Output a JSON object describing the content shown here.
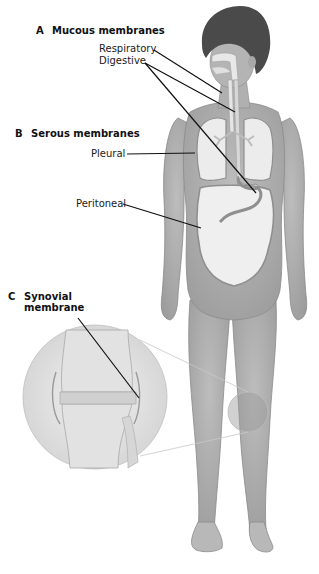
{
  "sections": {
    "a": {
      "letter": "A",
      "title": "Mucous membranes",
      "labels": {
        "respiratory": "Respiratory",
        "digestive": "Digestive"
      }
    },
    "b": {
      "letter": "B",
      "title": "Serous membranes",
      "labels": {
        "pleural": "Pleural",
        "peritoneal": "Peritoneal"
      }
    },
    "c": {
      "letter": "C",
      "title_line1": "Synovial",
      "title_line2": "membrane"
    }
  },
  "colors": {
    "background": "#ffffff",
    "skin": "#a9a9a9",
    "skin_light": "#c4c4c4",
    "hair": "#4a4a4a",
    "organ": "#ececec",
    "membrane": "#8f8f8f",
    "leader_line": "#111111",
    "bone": "#e2e2e2"
  }
}
